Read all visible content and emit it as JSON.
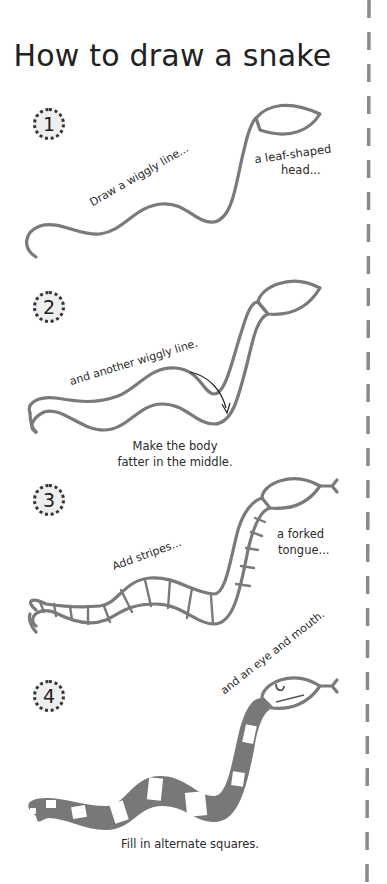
{
  "title": "How to draw a snake",
  "colors": {
    "ink": "#222222",
    "snake_stroke": "#7a7a7a",
    "snake_fill": "#787878",
    "badge_bg": "#eeeeee",
    "dashed_border": "#8a8a8a"
  },
  "steps": [
    {
      "number": "1",
      "captions": [
        "Draw a wiggly line...",
        "a leaf-shaped",
        "head..."
      ]
    },
    {
      "number": "2",
      "captions": [
        "and another wiggly line.",
        "Make the body",
        "fatter in the middle."
      ]
    },
    {
      "number": "3",
      "captions": [
        "Add stripes...",
        "a forked",
        "tongue..."
      ]
    },
    {
      "number": "4",
      "captions": [
        "and an eye and mouth.",
        "Fill in alternate squares."
      ]
    }
  ]
}
